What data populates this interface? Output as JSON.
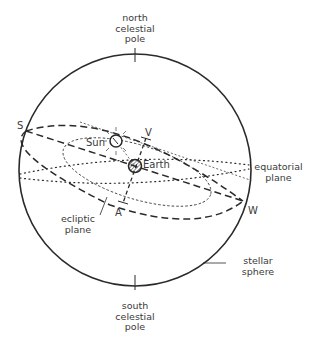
{
  "diagram": {
    "labels": {
      "north_pole": [
        "north",
        "celestial",
        "pole"
      ],
      "south_pole": [
        "south",
        "celestial",
        "pole"
      ],
      "equatorial_plane": [
        "equatorial",
        "plane"
      ],
      "ecliptic_plane": [
        "ecliptic",
        "plane"
      ],
      "stellar_sphere": [
        "stellar",
        "sphere"
      ],
      "sun": "Sun",
      "earth": "Earth",
      "point_s": "S",
      "point_w": "W",
      "point_v": "V",
      "point_a": "A"
    },
    "colors": {
      "line": "#2a2a2a",
      "background": "#ffffff"
    }
  }
}
